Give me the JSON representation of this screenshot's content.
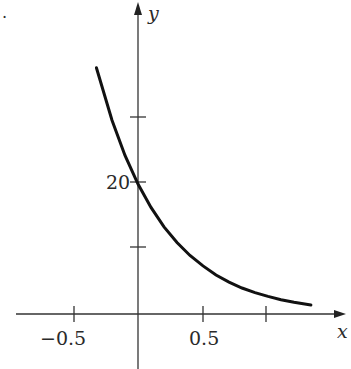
{
  "chart_data": {
    "type": "line",
    "title": "",
    "xlabel": "x",
    "ylabel": "y",
    "x_ticks": [
      -0.5,
      0.5,
      1.0
    ],
    "x_tick_labels": [
      "−0.5",
      "0.5",
      ""
    ],
    "y_ticks": [
      10,
      20,
      30
    ],
    "y_tick_labels": [
      "",
      "20",
      ""
    ],
    "xlim": [
      -1.0,
      1.55
    ],
    "ylim": [
      -8,
      48
    ],
    "grid": false,
    "legend": null,
    "series": [
      {
        "name": "y = 20e^(-2x)",
        "x": [
          -0.32,
          -0.2,
          -0.1,
          0.0,
          0.1,
          0.2,
          0.3,
          0.4,
          0.5,
          0.6,
          0.7,
          0.8,
          0.9,
          1.0,
          1.1,
          1.2,
          1.33
        ],
        "y": [
          37.9,
          29.8,
          24.4,
          20.0,
          16.4,
          13.4,
          11.0,
          9.0,
          7.4,
          6.0,
          4.9,
          4.0,
          3.3,
          2.7,
          2.2,
          1.8,
          1.4
        ]
      }
    ]
  },
  "labels": {
    "x_axis": "x",
    "y_axis": "y",
    "tick_neg_half": "−0.5",
    "tick_half": "0.5",
    "tick_twenty": "20",
    "corner_mark": "."
  }
}
